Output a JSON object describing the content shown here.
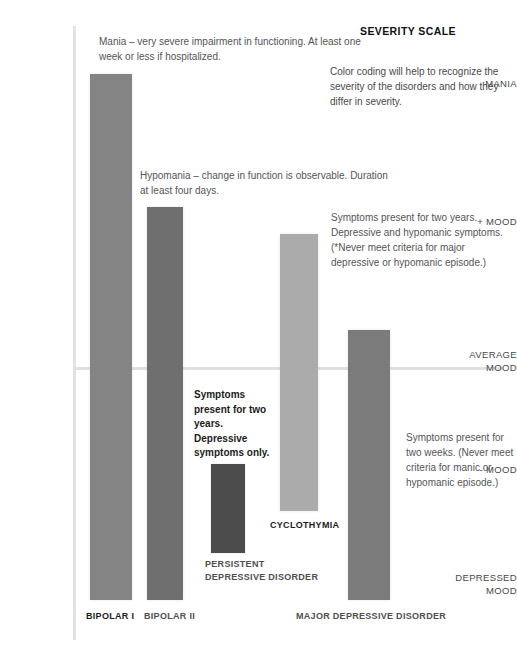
{
  "header": {
    "title": "SEVERITY SCALE",
    "description": "Color coding will help to recognize the severity of the disorders and how they differ in severity."
  },
  "axis": {
    "y_labels": [
      {
        "key": "mania",
        "text": "MANIA"
      },
      {
        "key": "plus_mood",
        "text": "+ MOOD"
      },
      {
        "key": "average",
        "text": "AVERAGE\nMOOD"
      },
      {
        "key": "minus_mood",
        "text": "- MOOD"
      },
      {
        "key": "depressed",
        "text": "DEPRESSED\nMOOD"
      }
    ],
    "baseline_label": "AVERAGE MOOD"
  },
  "notes": {
    "mania": "Mania – very severe impairment in functioning. At least one week or less if hospitalized.",
    "hypomania": "Hypomania – change in function is observable. Duration at least four days.",
    "cyclothymia": "Symptoms present for two years. Depressive and hypomanic symptoms. (*Never meet criteria for major depressive or hypomanic episode.)",
    "persistent_depressive": "Symptoms present for two years. Depressive symptoms only.",
    "major_depressive": "Symptoms present for two weeks. (Never meet criteria for manic or hypomanic episode.)"
  },
  "chart_data": {
    "type": "bar",
    "title": "SEVERITY SCALE",
    "xlabel": "",
    "ylabel": "Mood severity",
    "grid": false,
    "legend": "none",
    "baseline": "AVERAGE MOOD",
    "y_axis_ticks": [
      "MANIA",
      "+ MOOD",
      "AVERAGE MOOD",
      "- MOOD",
      "DEPRESSED MOOD"
    ],
    "categories": [
      "BIPOLAR I",
      "BIPOLAR II",
      "PERSISTENT DEPRESSIVE DISORDER",
      "CYCLOTHYMIA",
      "MAJOR DEPRESSIVE DISORDER"
    ],
    "series": [
      {
        "name": "Mood range",
        "bars": [
          {
            "category": "BIPOLAR I",
            "label": "BIPOLAR I",
            "top_level": "MANIA",
            "bottom_level": "DEPRESSED MOOD",
            "color": "#848484",
            "x": 90,
            "y": 74,
            "width": 42,
            "height": 526
          },
          {
            "category": "BIPOLAR II",
            "label": "BIPOLAR II",
            "top_level": "+ MOOD (hypomania)",
            "bottom_level": "DEPRESSED MOOD",
            "color": "#6f6f6f",
            "x": 147,
            "y": 207,
            "width": 36,
            "height": 393
          },
          {
            "category": "PERSISTENT DEPRESSIVE DISORDER",
            "label": "PERSISTENT DEPRESSIVE DISORDER",
            "top_level": "below AVERAGE MOOD",
            "bottom_level": "- MOOD",
            "color": "#4c4c4c",
            "x": 211,
            "y": 464,
            "width": 34,
            "height": 89
          },
          {
            "category": "CYCLOTHYMIA",
            "label": "CYCLOTHYMIA",
            "top_level": "between + MOOD and AVERAGE MOOD",
            "bottom_level": "- MOOD",
            "color": "#ababab",
            "x": 280,
            "y": 234,
            "width": 38,
            "height": 277
          },
          {
            "category": "MAJOR DEPRESSIVE DISORDER",
            "label": "MAJOR DEPRESSIVE DISORDER",
            "top_level": "slightly above AVERAGE MOOD",
            "bottom_level": "DEPRESSED MOOD",
            "color": "#7b7b7b",
            "x": 348,
            "y": 330,
            "width": 42,
            "height": 270
          }
        ]
      }
    ],
    "colors": {
      "bipolar_i": "#848484",
      "bipolar_ii": "#6f6f6f",
      "persistent_depressive_disorder": "#4c4c4c",
      "cyclothymia": "#ababab",
      "major_depressive_disorder": "#7b7b7b",
      "axis": "#e2e2e2",
      "background": "#ffffff",
      "text": "#555555"
    }
  }
}
